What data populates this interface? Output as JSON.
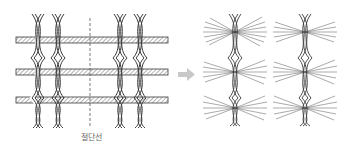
{
  "diagram": {
    "left_panel": {
      "description": "Leno-woven fabric with pairs of twisted warp cords and horizontal weft strands",
      "cut_line_label": "절단선",
      "warp_columns_x": [
        38,
        58,
        120,
        140
      ],
      "weft_rows_y": [
        40,
        72,
        100
      ],
      "cut_line_x": 90
    },
    "arrow": {
      "icon": "right-arrow-icon",
      "color": "#c8c8c8"
    },
    "right_panel": {
      "description": "Resulting chenille yarns after cutting, with fringed pile tufts",
      "yarn_columns_x": [
        235,
        305
      ],
      "tuft_rows_y": [
        30,
        72,
        110
      ]
    },
    "colors": {
      "line": "#3a3a3a",
      "tuft": "#555555",
      "arrow": "#c8c8c8",
      "label": "#666666"
    }
  }
}
